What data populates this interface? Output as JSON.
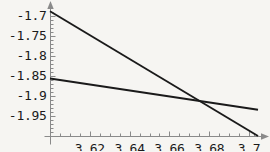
{
  "chart_data": {
    "type": "line",
    "title": "",
    "xlabel": "",
    "ylabel": "",
    "xlim": [
      3.6,
      3.7045
    ],
    "ylim": [
      -2.0,
      -1.6805
    ],
    "grid": false,
    "legend": null,
    "background_color": "#f6f5f2",
    "axis_color": "#8a8a8a",
    "line_color": "#1a1a1a",
    "axes": {
      "x_axis_position_y": -2.0,
      "y_axis_position_x": 3.6,
      "x_arrow": true,
      "y_arrow": true
    },
    "x_ticks": [
      {
        "value": 3.62,
        "label": "3.62"
      },
      {
        "value": 3.64,
        "label": "3.64"
      },
      {
        "value": 3.66,
        "label": "3.66"
      },
      {
        "value": 3.68,
        "label": "3.68"
      },
      {
        "value": 3.7,
        "label": "3.7"
      }
    ],
    "x_minor_ticks": [
      3.605,
      3.61,
      3.615,
      3.625,
      3.63,
      3.635,
      3.645,
      3.65,
      3.655,
      3.665,
      3.67,
      3.675,
      3.685,
      3.69,
      3.695,
      3.7025
    ],
    "y_ticks": [
      {
        "value": -1.7,
        "label": "-1.7"
      },
      {
        "value": -1.75,
        "label": "-1.75"
      },
      {
        "value": -1.8,
        "label": "-1.8"
      },
      {
        "value": -1.85,
        "label": "-1.85"
      },
      {
        "value": -1.9,
        "label": "-1.9"
      },
      {
        "value": -1.95,
        "label": "-1.95"
      }
    ],
    "y_minor_ticks": [
      -1.69,
      -1.71,
      -1.72,
      -1.73,
      -1.74,
      -1.76,
      -1.77,
      -1.78,
      -1.79,
      -1.81,
      -1.82,
      -1.83,
      -1.84,
      -1.86,
      -1.87,
      -1.88,
      -1.89,
      -1.91,
      -1.92,
      -1.93,
      -1.94,
      -1.96,
      -1.97,
      -1.98,
      -1.99
    ],
    "series": [
      {
        "name": "steep-line",
        "points": [
          [
            3.6,
            -1.6885
          ],
          [
            3.7045,
            -2.0
          ]
        ],
        "slope": -2.982,
        "color": "#1a1a1a",
        "width": 1.9
      },
      {
        "name": "shallow-line",
        "points": [
          [
            3.6,
            -1.8565
          ],
          [
            3.7045,
            -1.9345
          ]
        ],
        "slope": -0.747,
        "color": "#1a1a1a",
        "width": 1.9
      }
    ],
    "intersection": {
      "x": 3.6665,
      "y": -1.9146
    }
  }
}
